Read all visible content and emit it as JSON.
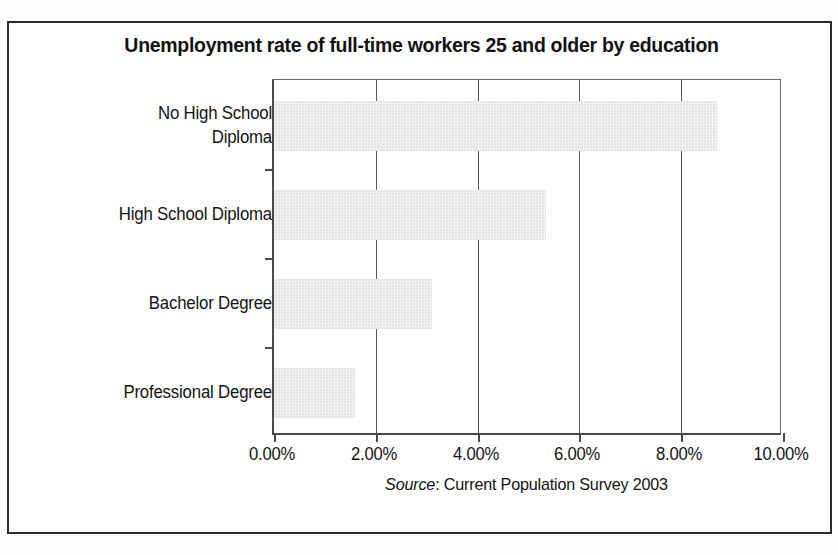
{
  "chart_data": {
    "type": "bar",
    "orientation": "horizontal",
    "title": "Unemployment rate of full-time workers 25 and older by education",
    "categories": [
      "No High School Diploma",
      "High School Diploma",
      "Bachelor Degree",
      "Professional Degree"
    ],
    "values": [
      8.7,
      5.35,
      3.1,
      1.6
    ],
    "xlabel": "",
    "ylabel": "",
    "xlim": [
      0,
      10
    ],
    "xtick_values": [
      0,
      2,
      4,
      6,
      8,
      10
    ],
    "xtick_labels": [
      "0.00%",
      "2.00%",
      "4.00%",
      "6.00%",
      "8.00%",
      "10.00%"
    ],
    "unit": "%",
    "grid": "vertical",
    "legend": "none",
    "bar_color": "#e3e3e3",
    "axis_color": "#4a4a4a"
  },
  "source": {
    "label": "Source",
    "separator": ": ",
    "text": "Current Population Survey 2003"
  },
  "category_label_lines": [
    [
      "No High School",
      "Diploma"
    ],
    [
      "High School Diploma"
    ],
    [
      "Bachelor Degree"
    ],
    [
      "Professional Degree"
    ]
  ]
}
